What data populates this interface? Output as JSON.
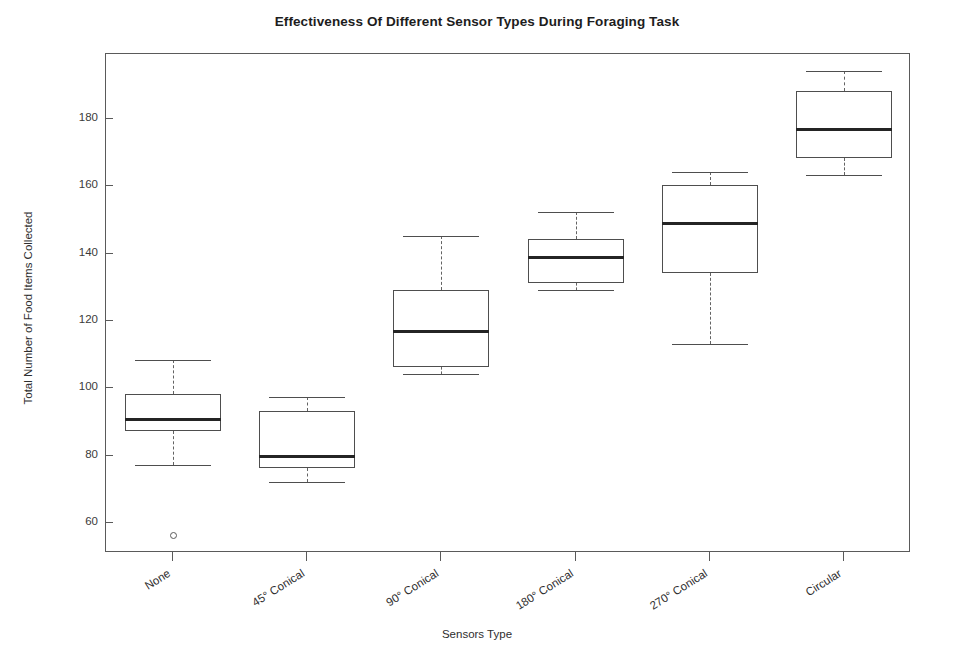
{
  "chart_data": {
    "type": "box",
    "title": "Effectiveness Of Different Sensor Types During Foraging Task",
    "xlabel": "Sensors Type",
    "ylabel": "Total Number of Food Items Collected",
    "categories": [
      "None",
      "45° Conical",
      "90° Conical",
      "180° Conical",
      "270° Conical",
      "Circular"
    ],
    "yticks": [
      60,
      80,
      100,
      120,
      140,
      160,
      180
    ],
    "ylim": [
      35,
      200
    ],
    "grid": false,
    "legend": null,
    "boxes": [
      {
        "category": "None",
        "whisker_low": 77,
        "q1": 87,
        "median": 91,
        "q3": 98,
        "whisker_high": 108,
        "outliers": [
          56
        ]
      },
      {
        "category": "45° Conical",
        "whisker_low": 72,
        "q1": 76,
        "median": 80,
        "q3": 93,
        "whisker_high": 97,
        "outliers": []
      },
      {
        "category": "90° Conical",
        "whisker_low": 104,
        "q1": 106,
        "median": 117,
        "q3": 129,
        "whisker_high": 145,
        "outliers": []
      },
      {
        "category": "180° Conical",
        "whisker_low": 129,
        "q1": 131,
        "median": 139,
        "q3": 144,
        "whisker_high": 152,
        "outliers": []
      },
      {
        "category": "270° Conical",
        "whisker_low": 113,
        "q1": 134,
        "median": 149,
        "q3": 160,
        "whisker_high": 164,
        "outliers": []
      },
      {
        "category": "Circular",
        "whisker_low": 163,
        "q1": 168,
        "median": 177,
        "q3": 188,
        "whisker_high": 194,
        "outliers": []
      }
    ]
  },
  "colors": {
    "box_edge": "#4e4e4e",
    "median": "#242424",
    "whisker": "#636363",
    "frame": "#5a5a5a",
    "text": "#2e2e2e",
    "background": "#ffffff"
  }
}
